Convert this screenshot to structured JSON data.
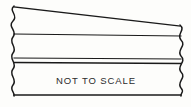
{
  "figure": {
    "title_note": "NOT TO SCALE",
    "note_position": {
      "x": 96,
      "y": 80
    },
    "background_color": "#fdfdfb",
    "line_color": "#1a1a1a",
    "text_color": "#2b2b2b",
    "icons": {
      "left_break": "wavy-break-line-icon",
      "right_break": "wavy-break-line-icon"
    },
    "geometry": {
      "top_edge": {
        "x1": 14,
        "y1": 7,
        "x2": 180,
        "y2": 26
      },
      "layer_line_1": {
        "x1": 14,
        "y1": 34,
        "x2": 181,
        "y2": 36
      },
      "layer_line_2": {
        "x1": 14,
        "y1": 58,
        "x2": 181,
        "y2": 59
      },
      "layer_line_3": {
        "x1": 14,
        "y1": 62,
        "x2": 181,
        "y2": 63
      },
      "bottom_edge": {
        "x1": 14,
        "y1": 95,
        "x2": 181,
        "y2": 95
      },
      "left_break_x": 14,
      "right_break_x": 181
    }
  }
}
